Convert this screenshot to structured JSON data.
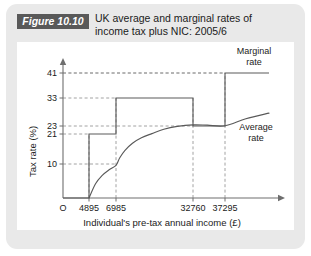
{
  "figure": {
    "badge": "Figure 10.10",
    "title_line1": "UK average and marginal rates of",
    "title_line2": "income tax plus NIC: 2005/6",
    "panel_bg": "#e9e9e9",
    "badge_bg": "#595959",
    "plot_bg": "#ffffff",
    "line_color": "#5a5a5a",
    "grid_color": "#8c8c8c",
    "axis_color": "#6e6e6e"
  },
  "chart_data": {
    "type": "line",
    "title": "UK average and marginal rates of income tax plus NIC: 2005/6",
    "xlabel": "Individual's pre-tax annual income (£)",
    "ylabel": "Tax rate (%)",
    "origin_label": "O",
    "grid": "dashed-both",
    "legend_position": "inline-right",
    "x_ticks": [
      4895,
      6985,
      32760,
      37295
    ],
    "x_tick_labels": [
      "4895",
      "6985",
      "32760",
      "37295"
    ],
    "y_ticks": [
      10,
      21,
      23,
      33,
      41
    ],
    "y_tick_labels": [
      "10",
      "21",
      "23",
      "33",
      "41"
    ],
    "ylim": [
      0,
      45
    ],
    "series": [
      {
        "name": "Marginal rate",
        "type": "step",
        "label": "Marginal",
        "label_line2": "rate",
        "points": [
          {
            "x": 0,
            "y": 0
          },
          {
            "x": 4895,
            "y": 0
          },
          {
            "x": 4895,
            "y": 21
          },
          {
            "x": 6985,
            "y": 21
          },
          {
            "x": 6985,
            "y": 33
          },
          {
            "x": 32760,
            "y": 33
          },
          {
            "x": 32760,
            "y": 23
          },
          {
            "x": 37295,
            "y": 23
          },
          {
            "x": 37295,
            "y": 41
          },
          {
            "x": 43000,
            "y": 41
          }
        ]
      },
      {
        "name": "Average rate",
        "type": "curve",
        "label": "Average",
        "label_line2": "rate",
        "points": [
          {
            "x": 4895,
            "y": 0.0
          },
          {
            "x": 5400,
            "y": 4.2
          },
          {
            "x": 5900,
            "y": 6.6
          },
          {
            "x": 6450,
            "y": 8.3
          },
          {
            "x": 6985,
            "y": 9.6
          },
          {
            "x": 8200,
            "y": 12.2
          },
          {
            "x": 10000,
            "y": 15.0
          },
          {
            "x": 12500,
            "y": 17.6
          },
          {
            "x": 15500,
            "y": 19.6
          },
          {
            "x": 19000,
            "y": 21.1
          },
          {
            "x": 23000,
            "y": 22.2
          },
          {
            "x": 27500,
            "y": 22.9
          },
          {
            "x": 32760,
            "y": 23.4
          },
          {
            "x": 34800,
            "y": 23.3
          },
          {
            "x": 37295,
            "y": 23.1
          },
          {
            "x": 40000,
            "y": 25.6
          },
          {
            "x": 43000,
            "y": 27.6
          }
        ]
      }
    ]
  }
}
